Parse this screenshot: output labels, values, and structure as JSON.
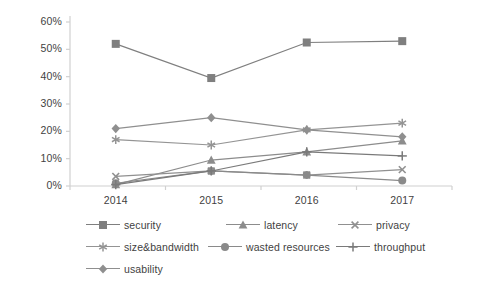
{
  "chart_data": {
    "type": "line",
    "title": "",
    "xlabel": "",
    "ylabel": "",
    "categories": [
      "2014",
      "2015",
      "2016",
      "2017"
    ],
    "x": [
      2014,
      2015,
      2016,
      2017
    ],
    "ylim": [
      0,
      60
    ],
    "ytick_labels": [
      "0%",
      "10%",
      "20%",
      "30%",
      "40%",
      "50%",
      "60%"
    ],
    "ytick_values": [
      0,
      10,
      20,
      30,
      40,
      50,
      60
    ],
    "grid": false,
    "legend_position": "bottom",
    "series": [
      {
        "name": "security",
        "marker": "square",
        "color": "#7f7f7f",
        "values": [
          52,
          39.5,
          52.5,
          53
        ]
      },
      {
        "name": "latency",
        "marker": "triangle",
        "color": "#8c8c8c",
        "values": [
          0.5,
          9.5,
          12.5,
          16.5
        ]
      },
      {
        "name": "privacy",
        "marker": "x",
        "color": "#909090",
        "values": [
          3.5,
          5.5,
          4,
          6
        ]
      },
      {
        "name": "size&bandwidth",
        "marker": "asterisk",
        "color": "#949494",
        "values": [
          17,
          15,
          20.5,
          23
        ]
      },
      {
        "name": "wasted resources",
        "marker": "circle",
        "color": "#8a8a8a",
        "values": [
          1,
          5.5,
          4,
          2
        ]
      },
      {
        "name": "throughput",
        "marker": "plus",
        "color": "#7a7a7a",
        "values": [
          0.5,
          5.5,
          12.5,
          11
        ]
      },
      {
        "name": "usability",
        "marker": "diamond",
        "color": "#8f8f8f",
        "values": [
          21,
          25,
          20.5,
          18
        ]
      }
    ]
  },
  "axes": {
    "x_tick_labels": [
      "2014",
      "2015",
      "2016",
      "2017"
    ],
    "y_tick_labels": [
      "60%",
      "50%",
      "40%",
      "30%",
      "20%",
      "10%",
      "0%"
    ]
  },
  "legend": {
    "items": [
      {
        "label": "security",
        "marker": "square-marker-icon"
      },
      {
        "label": "latency",
        "marker": "triangle-marker-icon"
      },
      {
        "label": "privacy",
        "marker": "x-marker-icon"
      },
      {
        "label": "size&bandwidth",
        "marker": "asterisk-marker-icon"
      },
      {
        "label": "wasted resources",
        "marker": "circle-marker-icon"
      },
      {
        "label": "throughput",
        "marker": "plus-marker-icon"
      },
      {
        "label": "usability",
        "marker": "diamond-marker-icon"
      }
    ]
  },
  "colors": {
    "line": "#8c8c8c",
    "axis": "#d0d0d0",
    "text": "#3f3f3f",
    "background": "#ffffff"
  }
}
